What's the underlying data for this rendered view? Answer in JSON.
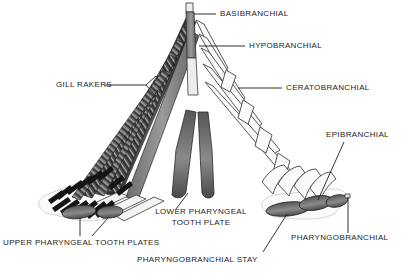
{
  "figure": {
    "type": "anatomical-diagram",
    "background_color": "#ffffff",
    "ink_color": "#1c1c1c",
    "shade_dark": "#3a3a3a",
    "shade_mid": "#8d8d8d",
    "shade_light": "#d8d8d8"
  },
  "labels": {
    "basibranchial": "BASIBRANCHIAL",
    "hypobranchial": "HYPOBRANCHIAL",
    "ceratobranchial": "CERATOBRANCHIAL",
    "epibranchial": "EPIBRANCHIAL",
    "pharyngobranchial": "PHARYNGOBRANCHIAL",
    "pharyngobranchial_stay": "PHARYNGOBRANCHIAL STAY",
    "gill_rakers": "GILL RAKERS",
    "lower_pharyngeal_tooth_plate": "LOWER PHARYNGEAL\nTOOTH PLATE",
    "lower_pharyngeal_line1": "LOWER PHARYNGEAL",
    "lower_pharyngeal_line2": "TOOTH PLATE",
    "upper_pharyngeal_tooth_plates": "UPPER PHARYNGEAL TOOTH PLATES"
  }
}
